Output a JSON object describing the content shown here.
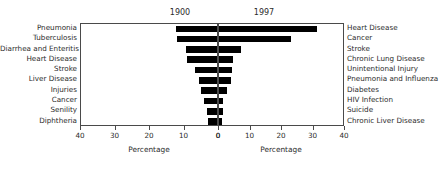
{
  "chart_data": {
    "type": "bar",
    "orientation": "horizontal",
    "layout": "back-to-back population pyramid (two mirrored panels)",
    "title": "",
    "panels": [
      {
        "name": "left",
        "title": "1900",
        "xlabel": "Percentage",
        "direction": "right-to-left",
        "xlim": [
          40,
          0
        ],
        "ticks": [
          40,
          30,
          20,
          10,
          0
        ],
        "ticklabels": [
          "40",
          "30",
          "20",
          "10",
          "0"
        ],
        "grid": false,
        "categories": [
          "Pneumonia",
          "Tuberculosis",
          "Diarrhea and Enteritis",
          "Heart Disease",
          "Stroke",
          "Liver Disease",
          "Injuries",
          "Cancer",
          "Senility",
          "Diphtheria"
        ],
        "values": [
          12.0,
          11.5,
          9.0,
          8.8,
          6.3,
          5.1,
          4.5,
          3.8,
          3.0,
          2.5
        ]
      },
      {
        "name": "right",
        "title": "1997",
        "xlabel": "Percentage",
        "direction": "left-to-right",
        "xlim": [
          0,
          40
        ],
        "ticks": [
          0,
          10,
          20,
          30,
          40
        ],
        "ticklabels": [
          "0",
          "10",
          "20",
          "30",
          "40"
        ],
        "grid": false,
        "categories": [
          "Heart Disease",
          "Cancer",
          "Stroke",
          "Chronic Lung Disease",
          "Unintentional Injury",
          "Pneumonia and Influenza",
          "Diabetes",
          "HIV Infection",
          "Suicide",
          "Chronic Liver Disease"
        ],
        "values": [
          31.0,
          23.0,
          6.9,
          4.6,
          4.0,
          3.7,
          2.6,
          1.2,
          1.3,
          1.1
        ]
      }
    ]
  },
  "axis": {
    "xlabel_left": "Percentage",
    "xlabel_right": "Percentage"
  },
  "colors": {
    "bar": "#000000",
    "frame": "#4a4a4a",
    "text": "#2b2b2b",
    "background": "#ffffff"
  }
}
